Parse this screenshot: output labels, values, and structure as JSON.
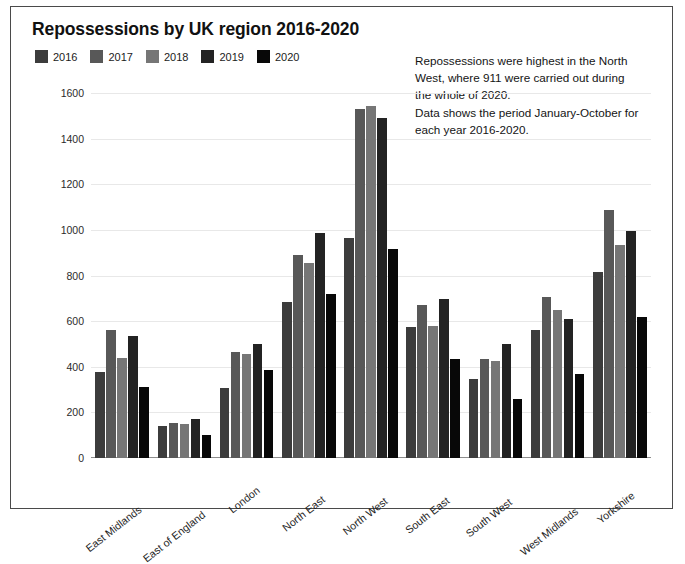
{
  "chart_data": {
    "type": "bar",
    "title": "Repossessions by UK region 2016-2020",
    "xlabel": "",
    "ylabel": "",
    "ylim": [
      0,
      1600
    ],
    "yticks": [
      0,
      200,
      400,
      600,
      800,
      1000,
      1200,
      1400,
      1600
    ],
    "grid": true,
    "legend_position": "top-left",
    "categories": [
      "East Midlands",
      "East of England",
      "London",
      "North East",
      "North West",
      "South East",
      "South West",
      "West Midlands",
      "Yorkshire"
    ],
    "series": [
      {
        "name": "2016",
        "color": "#3c3c3c",
        "values": [
          375,
          140,
          305,
          685,
          965,
          575,
          345,
          560,
          815
        ]
      },
      {
        "name": "2017",
        "color": "#585858",
        "values": [
          560,
          155,
          465,
          890,
          1530,
          670,
          435,
          705,
          1085
        ]
      },
      {
        "name": "2018",
        "color": "#767676",
        "values": [
          440,
          150,
          455,
          855,
          1545,
          580,
          425,
          650,
          935
        ]
      },
      {
        "name": "2019",
        "color": "#232323",
        "values": [
          535,
          170,
          500,
          985,
          1490,
          695,
          500,
          610,
          995
        ]
      },
      {
        "name": "2020",
        "color": "#080808",
        "values": [
          310,
          100,
          385,
          720,
          915,
          435,
          260,
          370,
          620
        ]
      }
    ],
    "annotations": [
      "Repossessions were highest in the North",
      "West, where 911 were carried out during",
      "the whole of 2020.",
      "Data shows the period January-October for",
      "each year 2016-2020."
    ]
  }
}
